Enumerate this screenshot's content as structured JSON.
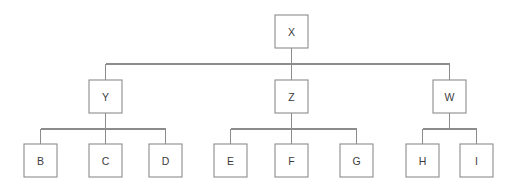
{
  "diagram": {
    "type": "tree",
    "canvas": {
      "width": 523,
      "height": 188,
      "background": "#ffffff"
    },
    "style": {
      "line_color": "#8c8c8c",
      "box_fill": "#ffffff",
      "box_stroke": "#8c8c8c",
      "label_color": "#3c3c3c",
      "box_size": 33,
      "stroke_width": 1.1
    },
    "levels": [
      {
        "index": 0,
        "box_top": 15,
        "connector_y": 64
      },
      {
        "index": 1,
        "box_top": 80,
        "connector_y": 129
      },
      {
        "index": 2,
        "box_top": 144,
        "connector_y": null
      }
    ],
    "nodes": [
      {
        "id": "X",
        "label": "X",
        "parent": null,
        "level": 0,
        "x": 275,
        "y": 15,
        "cx": 291.5
      },
      {
        "id": "Y",
        "label": "Y",
        "parent": "X",
        "level": 1,
        "x": 89,
        "y": 80,
        "cx": 105.5
      },
      {
        "id": "Z",
        "label": "Z",
        "parent": "X",
        "level": 1,
        "x": 275,
        "y": 80,
        "cx": 291.5
      },
      {
        "id": "W",
        "label": "W",
        "parent": "X",
        "level": 1,
        "x": 433,
        "y": 80,
        "cx": 449.5
      },
      {
        "id": "B",
        "label": "B",
        "parent": "Y",
        "level": 2,
        "x": 24,
        "y": 144,
        "cx": 40.5
      },
      {
        "id": "C",
        "label": "C",
        "parent": "Y",
        "level": 2,
        "x": 89,
        "y": 144,
        "cx": 105.5
      },
      {
        "id": "D",
        "label": "D",
        "parent": "Y",
        "level": 2,
        "x": 149,
        "y": 144,
        "cx": 165.5
      },
      {
        "id": "E",
        "label": "E",
        "parent": "Z",
        "level": 2,
        "x": 214,
        "y": 144,
        "cx": 230.5
      },
      {
        "id": "F",
        "label": "F",
        "parent": "Z",
        "level": 2,
        "x": 275,
        "y": 144,
        "cx": 291.5
      },
      {
        "id": "G",
        "label": "G",
        "parent": "Z",
        "level": 2,
        "x": 340,
        "y": 144,
        "cx": 356.5
      },
      {
        "id": "H",
        "label": "H",
        "parent": "W",
        "level": 2,
        "x": 406,
        "y": 144,
        "cx": 422.5
      },
      {
        "id": "I",
        "label": "I",
        "parent": "W",
        "level": 2,
        "x": 460,
        "y": 144,
        "cx": 476.5
      }
    ],
    "edges": [
      {
        "from": "X",
        "to": "Y"
      },
      {
        "from": "X",
        "to": "Z"
      },
      {
        "from": "X",
        "to": "W"
      },
      {
        "from": "Y",
        "to": "B"
      },
      {
        "from": "Y",
        "to": "C"
      },
      {
        "from": "Y",
        "to": "D"
      },
      {
        "from": "Z",
        "to": "E"
      },
      {
        "from": "Z",
        "to": "F"
      },
      {
        "from": "Z",
        "to": "G"
      },
      {
        "from": "W",
        "to": "H"
      },
      {
        "from": "W",
        "to": "I"
      }
    ],
    "connectors": [
      {
        "parent": "X",
        "bar_y": 64,
        "bar_x1": 105.5,
        "bar_x2": 449.5,
        "drop_from_y": 48,
        "drop_to_y": 80
      },
      {
        "parent": "Y",
        "bar_y": 129,
        "bar_x1": 40.5,
        "bar_x2": 165.5,
        "drop_from_y": 113,
        "drop_to_y": 144
      },
      {
        "parent": "Z",
        "bar_y": 129,
        "bar_x1": 230.5,
        "bar_x2": 356.5,
        "drop_from_y": 113,
        "drop_to_y": 144
      },
      {
        "parent": "W",
        "bar_y": 129,
        "bar_x1": 422.5,
        "bar_x2": 476.5,
        "drop_from_y": 113,
        "drop_to_y": 144
      }
    ]
  }
}
